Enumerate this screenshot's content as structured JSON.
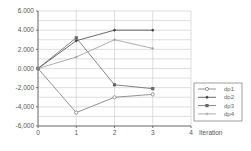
{
  "chart_data": {
    "type": "line",
    "title": "",
    "xlabel": "Iteration",
    "ylabel": "",
    "x": [
      0,
      1,
      2,
      3
    ],
    "xlim": [
      0,
      4
    ],
    "ylim": [
      -6,
      6
    ],
    "x_ticks": [
      "0",
      "1",
      "2",
      "3",
      "4"
    ],
    "y_ticks": [
      "6.000",
      "4.000",
      "2.000",
      "0.000",
      "-2,000",
      "-4,000",
      "-6,000"
    ],
    "grid": true,
    "legend_position": "right",
    "series": [
      {
        "name": "dp1",
        "values": [
          0.0,
          -4.6,
          -3.0,
          -2.7
        ],
        "marker": "open-circle",
        "color": "#777777"
      },
      {
        "name": "dp2",
        "values": [
          0.0,
          2.9,
          4.0,
          4.0
        ],
        "marker": "filled-diamond",
        "color": "#444444"
      },
      {
        "name": "dp3",
        "values": [
          0.0,
          3.2,
          -1.7,
          -2.1
        ],
        "marker": "filled-square",
        "color": "#666666"
      },
      {
        "name": "dp4",
        "values": [
          0.0,
          1.2,
          3.0,
          2.1
        ],
        "marker": "small-cross",
        "color": "#999999"
      }
    ]
  }
}
